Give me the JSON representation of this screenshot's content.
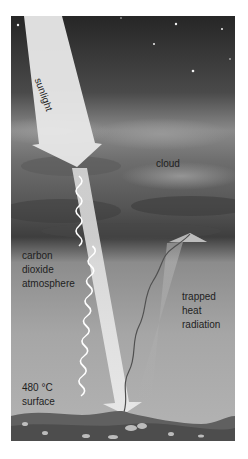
{
  "diagram": {
    "labels": {
      "sunlight": "sunlight",
      "cloud": "cloud",
      "atmosphere": [
        "carbon",
        "dioxide",
        "atmosphere"
      ],
      "heat": [
        "trapped",
        "heat",
        "radiation"
      ],
      "surface": [
        "480 °C",
        "surface"
      ]
    },
    "colors": {
      "sky_top": "#2e2e2e",
      "sky_mid": "#7a7a7a",
      "cloud_dark": "#4a4a4a",
      "lower_atmosphere": "#a9a9a9",
      "beam": "#e6e6e6",
      "heat_arrow": "#bdbdbd",
      "heat_line": "#555555",
      "ground": "#5e5e5e"
    }
  }
}
